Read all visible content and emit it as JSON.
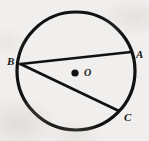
{
  "figure": {
    "type": "circle-geometry-diagram",
    "canvas": {
      "width": 149,
      "height": 141
    },
    "background_color": "#f1efed",
    "stroke_color": "#111111",
    "label_color": "#181818",
    "circle": {
      "name": "main-circle",
      "center_x": 76,
      "center_y": 71,
      "radius": 59,
      "stroke_width": 3.2
    },
    "center_point": {
      "name": "center-O",
      "x": 75,
      "y": 73,
      "dot_radius": 3.6,
      "label": "O",
      "label_x": 84,
      "label_y": 68
    },
    "points": [
      {
        "id": "B",
        "label": "B",
        "x": 20.5,
        "y": 64.0,
        "label_x": 7,
        "label_y": 56
      },
      {
        "id": "A",
        "label": "A",
        "x": 131.0,
        "y": 52.0,
        "label_x": 136,
        "label_y": 49
      },
      {
        "id": "C",
        "label": "C",
        "x": 119.0,
        "y": 111.0,
        "label_x": 124,
        "label_y": 112
      }
    ],
    "chords": [
      {
        "name": "chord-BA",
        "from": "B",
        "to": "A",
        "x1": 20.5,
        "y1": 64.0,
        "x2": 131.0,
        "y2": 52.0,
        "stroke_width": 2.6
      },
      {
        "name": "chord-BC",
        "from": "B",
        "to": "C",
        "x1": 20.5,
        "y1": 64.0,
        "x2": 119.0,
        "y2": 111.0,
        "stroke_width": 2.6
      }
    ]
  }
}
